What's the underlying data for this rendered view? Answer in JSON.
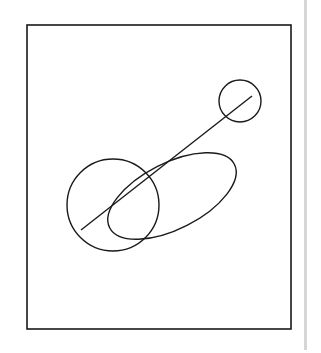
{
  "diagram": {
    "stroke_color": "#1a1a1a",
    "background": "#ffffff",
    "frame": {
      "x": 27,
      "y": 25,
      "width": 264,
      "height": 304
    },
    "line": {
      "x1": 81,
      "y1": 230,
      "x2": 252,
      "y2": 96
    },
    "small_circle": {
      "cx": 240,
      "cy": 101,
      "r": 21
    },
    "large_circle": {
      "cx": 113,
      "cy": 205,
      "r": 46
    },
    "ellipse": {
      "cx": 172,
      "cy": 196,
      "rx": 70,
      "ry": 33,
      "rotation": -27
    },
    "side_strip_color": "#d6d6d6"
  }
}
